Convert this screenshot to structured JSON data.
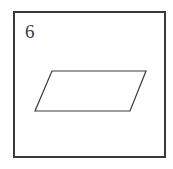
{
  "figure": {
    "item_number": "6",
    "background_color": "#ffffff",
    "frame": {
      "name": "outer-rectangle-border",
      "stroke_color": "#3a3a3c",
      "stroke_width": 2,
      "x": 13,
      "y": 11,
      "width": 153,
      "height": 147
    },
    "shapes": [
      {
        "name": "parallelogram",
        "type": "polygon",
        "points": "52,71 146,71 130,111 35,111",
        "stroke_color": "#3a3a3c",
        "stroke_width": 1.2,
        "fill": "none",
        "vertices": [
          {
            "label": "top-left",
            "x": 52,
            "y": 71
          },
          {
            "label": "top-right",
            "x": 146,
            "y": 71
          },
          {
            "label": "bottom-right",
            "x": 130,
            "y": 111
          },
          {
            "label": "bottom-left",
            "x": 35,
            "y": 111
          }
        ]
      }
    ]
  }
}
